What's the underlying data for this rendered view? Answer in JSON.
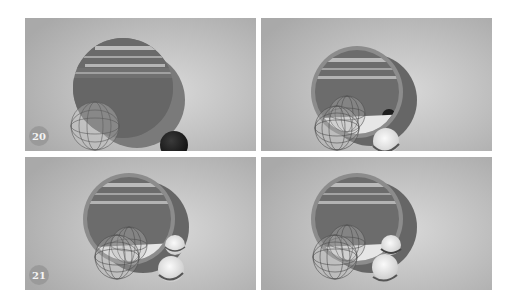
{
  "figure": {
    "layout": "2x2 grid of rendered frames",
    "panels": [
      {
        "id": "top-left",
        "label": "20",
        "objects": [
          "ring-disc-with-landscape",
          "wireframe-sphere",
          "dark-sphere"
        ]
      },
      {
        "id": "top-right",
        "label": "",
        "objects": [
          "ring-disc-with-landscape",
          "wireframe-spheres",
          "white-plane",
          "glass-sphere",
          "small-dark-sphere"
        ]
      },
      {
        "id": "bottom-left",
        "label": "21",
        "objects": [
          "ring-disc-with-landscape",
          "wireframe-spheres",
          "white-plane",
          "glass-spheres"
        ]
      },
      {
        "id": "bottom-right",
        "label": "",
        "objects": [
          "ring-disc-with-landscape",
          "wireframe-spheres",
          "white-plane",
          "glass-spheres"
        ]
      }
    ],
    "colors": {
      "background": "#c4c4c4",
      "disc": "#6e6e6e",
      "ring": "#8a8a8a",
      "dark_sphere": "#1c1c1c",
      "glass": "#e8e8e8"
    }
  }
}
